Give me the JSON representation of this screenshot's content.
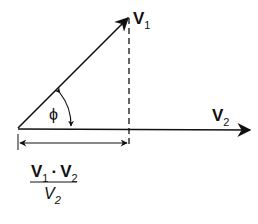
{
  "diagram": {
    "type": "vector-projection",
    "colors": {
      "stroke": "#111111",
      "background": "#ffffff"
    },
    "vectors": [
      {
        "name": "V",
        "subscript": "1",
        "from": [
          18,
          128
        ],
        "to": [
          128,
          18
        ]
      },
      {
        "name": "V",
        "subscript": "2",
        "from": [
          18,
          128
        ],
        "to": [
          250,
          130
        ]
      }
    ],
    "angle": {
      "label": "ϕ"
    },
    "projection": {
      "numerator": {
        "a": "V",
        "a_sub": "1",
        "op": "·",
        "b": "V",
        "b_sub": "2"
      },
      "denominator": {
        "v": "V",
        "v_sub": "2"
      }
    }
  }
}
